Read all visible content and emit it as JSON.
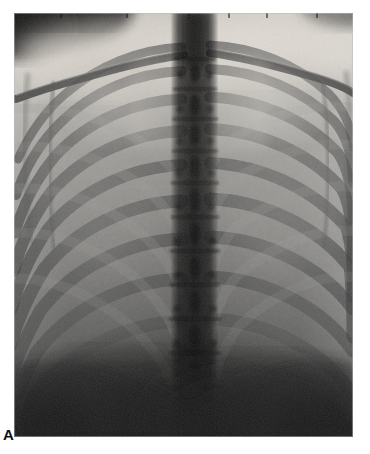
{
  "figure": {
    "panel_label": "A",
    "modality": "radiograph",
    "view": "chest frontal (AP/PA)",
    "background_color": "#ffffff",
    "plate": {
      "x": 14,
      "y": 13,
      "width": 339,
      "height": 424,
      "base_tone": "#6e6e6e",
      "border_color": "#b9b9b9"
    },
    "tones": {
      "soft_tissue_bright": "#d8d4cd",
      "lung_field_mid": "#8d8d8d",
      "bone_rib": "#4a4a4a",
      "spine_dark": "#262626",
      "diaphragm_dark": "#2b2b2b",
      "corner_shadow": "#141414",
      "noise_grain": "#000000"
    },
    "structures": [
      {
        "name": "upper-soft-tissue-shoulders",
        "note": "bright band across top"
      },
      {
        "name": "neck-shadow-top-left",
        "note": "dark curved corner shadow"
      },
      {
        "name": "clavicle-left",
        "note": "oblique bone arching to left shoulder"
      },
      {
        "name": "clavicle-right",
        "note": "oblique bone arching to right shoulder"
      },
      {
        "name": "thoracic-spine",
        "note": "dark vertical column, centre, segmented vertebrae"
      },
      {
        "name": "rib-cage-left",
        "note": "posterior + anterior ribs, 10 visible pairs"
      },
      {
        "name": "rib-cage-right",
        "note": "posterior + anterior ribs, 10 visible pairs"
      },
      {
        "name": "lung-field-left",
        "note": "mid-grey aerated field"
      },
      {
        "name": "lung-field-right",
        "note": "mid-grey aerated field"
      },
      {
        "name": "diaphragm-dome",
        "note": "dark region lower third"
      },
      {
        "name": "scapula-edge-left",
        "note": "faint vertical bone margin"
      },
      {
        "name": "scapula-edge-right",
        "note": "faint vertical bone margin"
      }
    ]
  }
}
